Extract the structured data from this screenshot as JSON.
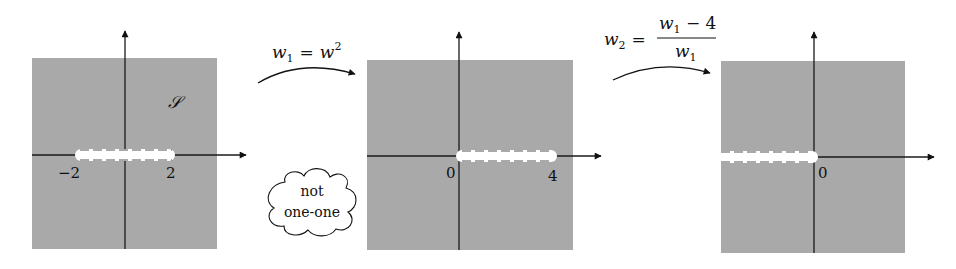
{
  "colors": {
    "region_fill": "#a9a9a9",
    "axis": "#1a1a1a",
    "slit": "#ffffff",
    "background": "#ffffff"
  },
  "panels": [
    {
      "id": "w-plane",
      "region_label": "𝒮",
      "slit": {
        "from": -2,
        "to": 2
      },
      "tick_labels": [
        "−2",
        "2"
      ]
    },
    {
      "id": "w1-plane",
      "slit": {
        "from": 0,
        "to": 4
      },
      "tick_labels": [
        "0",
        "4"
      ]
    },
    {
      "id": "w2-plane",
      "slit": {
        "from": "-∞",
        "to": 0
      },
      "tick_labels": [
        "0"
      ]
    }
  ],
  "maps": [
    {
      "lhs_var": "w",
      "lhs_sub": "1",
      "eq": "=",
      "rhs_var": "w",
      "rhs_sup": "2"
    },
    {
      "lhs_var": "w",
      "lhs_sub": "2",
      "eq": "=",
      "num_var": "w",
      "num_sub": "1",
      "num_rest": " − 4",
      "den_var": "w",
      "den_sub": "1"
    }
  ],
  "cloud": {
    "line1": "not",
    "line2": "one-one"
  }
}
